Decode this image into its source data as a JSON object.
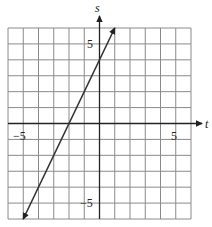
{
  "chart_data": {
    "type": "line",
    "title": "",
    "xlabel": "t",
    "ylabel": "s",
    "xlim": [
      -6,
      6
    ],
    "ylim": [
      -6,
      6
    ],
    "grid": true,
    "x_tick_labels": [
      "-5",
      "5"
    ],
    "y_tick_labels": [
      "5",
      "-5"
    ],
    "series": [
      {
        "name": "line",
        "equation": "s = 2t + 4",
        "x": [
          -5,
          1
        ],
        "y": [
          -6,
          6
        ],
        "arrows_both_ends": true
      }
    ],
    "legend": null
  },
  "labels": {
    "x_axis": "t",
    "y_axis": "s",
    "x_neg": "−5",
    "x_pos": "5",
    "y_pos": "5",
    "y_neg": "−5"
  },
  "colors": {
    "grid": "#8a8a8a",
    "axis": "#222222",
    "line": "#333333"
  }
}
